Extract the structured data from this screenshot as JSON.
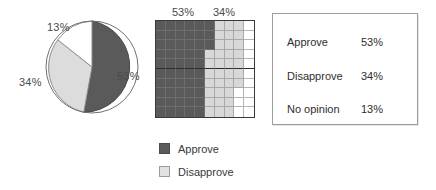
{
  "pie": {
    "labels": {
      "approve": "53%",
      "disapprove": "34%",
      "no_opinion": "13%"
    }
  },
  "grid": {
    "top_labels": {
      "approve": "53%",
      "disapprove": "34%"
    }
  },
  "legend": {
    "items": [
      {
        "label": "Approve",
        "swatch": "dark-gray-swatch-icon"
      },
      {
        "label": "Disapprove",
        "swatch": "light-gray-swatch-icon"
      }
    ]
  },
  "table": {
    "rows": [
      {
        "label": "Approve",
        "value": "53%"
      },
      {
        "label": "Disapprove",
        "value": "34%"
      },
      {
        "label": "No opinion",
        "value": "13%"
      }
    ]
  },
  "colors": {
    "approve": "#5a5a5a",
    "disapprove": "#d8d8d8",
    "no_opinion": "#ffffff",
    "outline": "#3a3a3a",
    "text": "#2e2e2e"
  },
  "chart_data": [
    {
      "type": "pie",
      "title": "",
      "categories": [
        "Approve",
        "Disapprove",
        "No opinion"
      ],
      "values": [
        53,
        34,
        13
      ],
      "unit": "%",
      "labels": [
        "53%",
        "34%",
        "13%"
      ],
      "colors": [
        "#5a5a5a",
        "#d8d8d8",
        "#ffffff"
      ],
      "start_angle": 0,
      "direction": "clockwise",
      "legend": "bottom-center",
      "grid": false
    },
    {
      "type": "waffle",
      "title": "",
      "categories": [
        "Approve",
        "Disapprove",
        "No opinion"
      ],
      "values": [
        53,
        34,
        13
      ],
      "unit": "%",
      "rows": 10,
      "columns": 10,
      "total_cells": 100,
      "annotations": [
        "53%",
        "34%"
      ],
      "colors": [
        "#5a5a5a",
        "#d8d8d8",
        "#ffffff"
      ],
      "grid": true,
      "legend": "bottom-left"
    },
    {
      "type": "table",
      "title": "",
      "columns": [
        "Response",
        "Percent"
      ],
      "rows": [
        [
          "Approve",
          "53%"
        ],
        [
          "Disapprove",
          "34%"
        ],
        [
          "No opinion",
          "13%"
        ]
      ]
    }
  ]
}
